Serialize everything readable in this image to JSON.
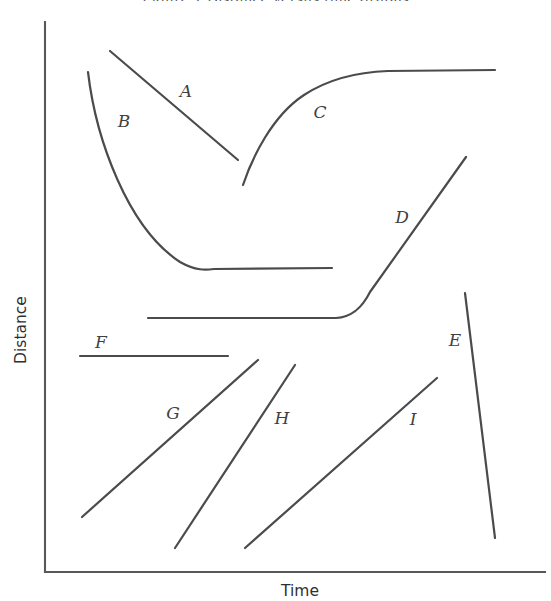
{
  "figure": {
    "background_color": "#ffffff",
    "line_color": "#4a4b4d",
    "axis_color": "#57585a",
    "clipped_top_caption": "Figure 1  Distance versus time graphs",
    "width": 551,
    "height": 601
  },
  "axes": {
    "y_label": "Distance",
    "x_label": "Time",
    "origin_x": 45,
    "origin_y": 572,
    "y_top": 22,
    "x_right": 545
  },
  "chart_data": {
    "type": "line",
    "title": "",
    "subtitle": "",
    "xlabel": "Time",
    "ylabel": "Distance",
    "xlim": [
      0,
      100
    ],
    "ylim": [
      0,
      100
    ],
    "grid": false,
    "legend": "none",
    "axis_ticks": {
      "x": [],
      "y": []
    },
    "annotations": [
      {
        "text": "A",
        "x": 186,
        "y": 97
      },
      {
        "text": "B",
        "x": 124,
        "y": 127
      },
      {
        "text": "C",
        "x": 320,
        "y": 118
      },
      {
        "text": "D",
        "x": 402,
        "y": 223
      },
      {
        "text": "E",
        "x": 455,
        "y": 346
      },
      {
        "text": "F",
        "x": 101,
        "y": 348
      },
      {
        "text": "G",
        "x": 173,
        "y": 419
      },
      {
        "text": "H",
        "x": 282,
        "y": 424
      },
      {
        "text": "I",
        "x": 413,
        "y": 425
      }
    ],
    "series": [
      {
        "name": "A",
        "label": "A",
        "shape": "straight-decreasing",
        "path": "M 110,51 L 238,160",
        "points": [
          [
            110,
            51
          ],
          [
            238,
            160
          ]
        ]
      },
      {
        "name": "B",
        "label": "B",
        "shape": "decreasing-decelerating-to-plateau",
        "path": "M 88,72 C 96,140 128,228 180,262 C 196,271 206,270 214,269 L 332,268",
        "points": [
          [
            88,
            72
          ],
          [
            140,
            185
          ],
          [
            180,
            262
          ],
          [
            214,
            269
          ],
          [
            332,
            268
          ]
        ]
      },
      {
        "name": "C",
        "label": "C",
        "shape": "increasing-decelerating-to-plateau",
        "path": "M 243,185 C 252,158 272,116 304,95 C 330,78 360,72 388,71 L 495,70",
        "points": [
          [
            243,
            185
          ],
          [
            304,
            95
          ],
          [
            388,
            71
          ],
          [
            495,
            70
          ]
        ]
      },
      {
        "name": "D",
        "label": "D",
        "shape": "flat-then-increasing",
        "path": "M 148,318 L 336,318 C 352,317 362,308 370,292 L 466,157",
        "points": [
          [
            148,
            318
          ],
          [
            336,
            318
          ],
          [
            370,
            292
          ],
          [
            466,
            157
          ]
        ]
      },
      {
        "name": "E",
        "label": "E",
        "shape": "steep-decreasing",
        "path": "M 465,293 L 495,538",
        "points": [
          [
            465,
            293
          ],
          [
            495,
            538
          ]
        ]
      },
      {
        "name": "F",
        "label": "F",
        "shape": "horizontal-constant",
        "path": "M 80,356 L 228,356",
        "points": [
          [
            80,
            356
          ],
          [
            228,
            356
          ]
        ]
      },
      {
        "name": "G",
        "label": "G",
        "shape": "straight-increasing-shallow",
        "path": "M 82,517 L 258,360",
        "points": [
          [
            82,
            517
          ],
          [
            258,
            360
          ]
        ]
      },
      {
        "name": "H",
        "label": "H",
        "shape": "straight-increasing-steep",
        "path": "M 175,548 L 295,365",
        "points": [
          [
            175,
            548
          ],
          [
            295,
            365
          ]
        ]
      },
      {
        "name": "I",
        "label": "I",
        "shape": "straight-increasing-shallow",
        "path": "M 245,548 L 437,378",
        "points": [
          [
            245,
            548
          ],
          [
            437,
            378
          ]
        ]
      }
    ]
  }
}
